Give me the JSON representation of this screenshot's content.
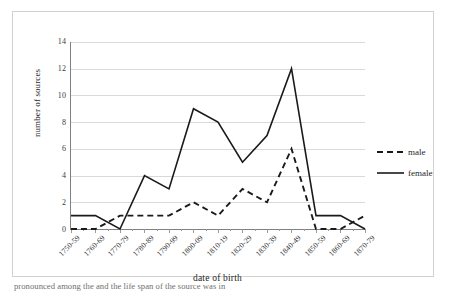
{
  "chart_data": {
    "type": "line",
    "title": "",
    "xlabel": "date of birth",
    "ylabel": "number of sources",
    "categories": [
      "1750-59",
      "1760-69",
      "1770-79",
      "1780-89",
      "1790-99",
      "1800-09",
      "1810-19",
      "1820-29",
      "1830-39",
      "1840-49",
      "1850-59",
      "1860-69",
      "1870-79"
    ],
    "series": [
      {
        "name": "male",
        "style": "dashed",
        "color": "#1a1a1a",
        "values": [
          0,
          0,
          1,
          1,
          1,
          2,
          1,
          3,
          2,
          6,
          0,
          0,
          1
        ]
      },
      {
        "name": "female",
        "style": "solid",
        "color": "#1a1a1a",
        "values": [
          1,
          1,
          0,
          4,
          3,
          9,
          8,
          5,
          7,
          12,
          1,
          1,
          0
        ]
      }
    ],
    "ylim": [
      0,
      14
    ],
    "yticks": [
      0,
      2,
      4,
      6,
      8,
      10,
      12,
      14
    ],
    "ytick_labels": [
      "0",
      "2",
      "4",
      "6",
      "8",
      "10",
      "12",
      "14"
    ],
    "grid": "horizontal",
    "legend_position": "right"
  },
  "legend": {
    "entries": [
      {
        "label": "male"
      },
      {
        "label": "female"
      }
    ]
  },
  "caption": {
    "text": "pronounced among the     and the life span of       the source was in "
  },
  "colors": {
    "line": "#1a1a1a",
    "grid": "#d9d9d9",
    "axis": "#808080",
    "frame": "#d2d2d2",
    "text": "#2a2a2a"
  }
}
